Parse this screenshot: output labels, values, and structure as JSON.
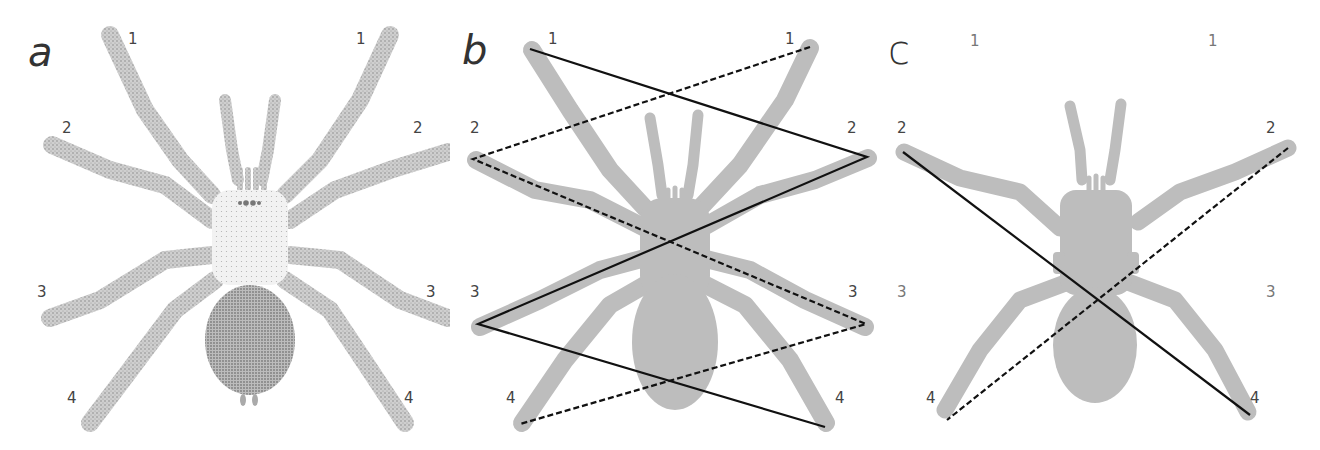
{
  "figure": {
    "panels": [
      {
        "letter": "a",
        "style": "stippled drawing",
        "leg_labels": {
          "left": [
            "1",
            "2",
            "3",
            "4"
          ],
          "right": [
            "1",
            "2",
            "3",
            "4"
          ]
        }
      },
      {
        "letter": "b",
        "style": "silhouette with gait lines",
        "leg_labels": {
          "left": [
            "1",
            "2",
            "3",
            "4"
          ],
          "right": [
            "1",
            "2",
            "3",
            "4"
          ]
        },
        "lines": [
          {
            "type": "solid",
            "path": [
              "L1",
              "R2",
              "L3",
              "R4"
            ]
          },
          {
            "type": "dashed",
            "path": [
              "R1",
              "L2",
              "R3",
              "L4"
            ]
          }
        ]
      },
      {
        "letter": "c",
        "style": "silhouette, legs 1 absent",
        "leg_labels": {
          "left": [
            "1",
            "2",
            "3",
            "4"
          ],
          "right": [
            "1",
            "2",
            "3",
            "4"
          ]
        },
        "lines": [
          {
            "type": "solid",
            "path": [
              "L2",
              "R4"
            ]
          },
          {
            "type": "dashed",
            "path": [
              "R2",
              "L4"
            ]
          }
        ]
      }
    ],
    "colors": {
      "silhouette": "#b8b8b8",
      "stipple": "#a9a9a9",
      "line": "#1a1a1a",
      "label": "#444444"
    }
  }
}
